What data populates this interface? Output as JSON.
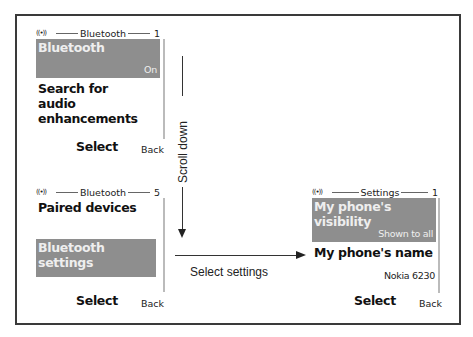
{
  "screens": [
    {
      "header": {
        "icon": "((•))",
        "title": "Bluetooth",
        "number": "1"
      },
      "items": [
        {
          "label": "Bluetooth",
          "value": "On",
          "selected": true
        },
        {
          "label": "Search for audio enhancements",
          "selected": false
        }
      ],
      "softkeys": {
        "left": "Select",
        "right": "Back"
      }
    },
    {
      "header": {
        "icon": "((•))",
        "title": "Bluetooth",
        "number": "5"
      },
      "items": [
        {
          "label": "Paired devices",
          "selected": false
        },
        {
          "label": "Bluetooth settings",
          "selected": true
        }
      ],
      "softkeys": {
        "left": "Select",
        "right": "Back"
      }
    },
    {
      "header": {
        "icon": "((•))",
        "title": "Settings",
        "number": "1"
      },
      "items": [
        {
          "label": "My phone's visibility",
          "value": "Shown to all",
          "selected": true
        },
        {
          "label": "My phone's name",
          "value": "Nokia 6230",
          "selected": false
        }
      ],
      "softkeys": {
        "left": "Select",
        "right": "Back"
      }
    }
  ],
  "arrows": {
    "scroll_down": "Scroll down",
    "select_settings": "Select settings"
  }
}
